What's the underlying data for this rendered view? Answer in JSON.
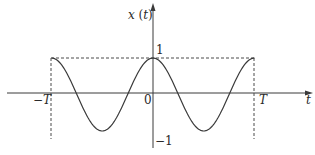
{
  "figure": {
    "y_axis_label": "x (t)",
    "x_axis_label": "t",
    "tick_labels": {
      "neg_T": "−T",
      "zero": "0",
      "pos_T": "T",
      "one": "1",
      "neg_one": "−1"
    }
  },
  "chart_data": {
    "type": "line",
    "title": "",
    "xlabel": "t",
    "ylabel": "x(t)",
    "function": "x(t) = cos(2πt/T), shown on −T ≤ t ≤ T",
    "xlim": [
      "-T",
      "T"
    ],
    "ylim": [
      -1,
      1
    ],
    "x_ticks": [
      "−T",
      "0",
      "T"
    ],
    "y_ticks": [
      "1",
      "−1"
    ],
    "key_points": [
      {
        "t": "-T",
        "x": 1
      },
      {
        "t": "-3T/4",
        "x": 0
      },
      {
        "t": "-T/2",
        "x": -1
      },
      {
        "t": "-T/4",
        "x": 0
      },
      {
        "t": "0",
        "x": 1
      },
      {
        "t": "T/4",
        "x": 0
      },
      {
        "t": "T/2",
        "x": -1
      },
      {
        "t": "3T/4",
        "x": 0
      },
      {
        "t": "T",
        "x": 1
      }
    ],
    "annotations": [
      "dashed horizontal line at x = 1 from t = −T to t = T",
      "dashed vertical lines at t = −T and t = T"
    ],
    "grid": false
  }
}
